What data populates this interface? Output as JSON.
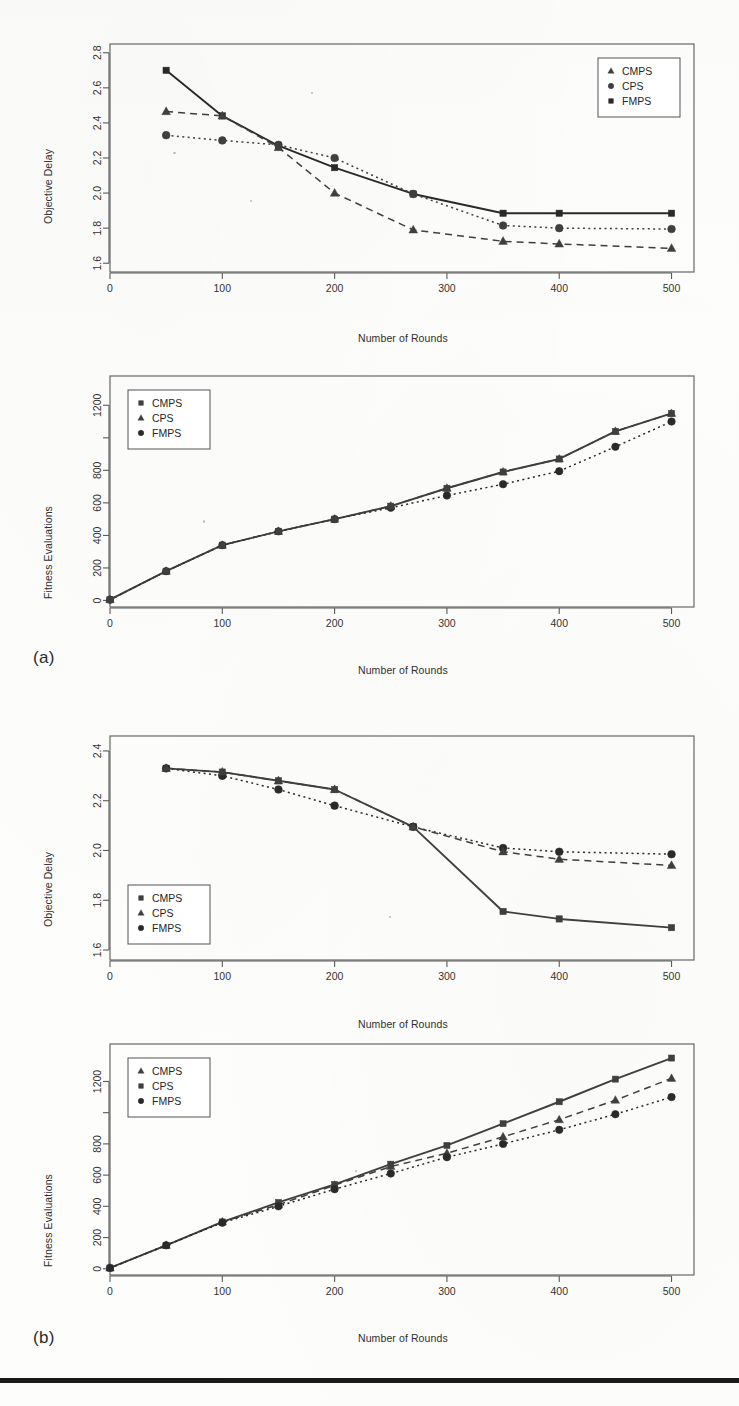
{
  "figure": {
    "panels": [
      {
        "id": "a",
        "label": "(a)"
      },
      {
        "id": "b",
        "label": "(b)"
      }
    ],
    "footer_rule_color": "#1a1a1a"
  },
  "series_style": {
    "CMPS": {
      "color": "#3f3f3f"
    },
    "CPS": {
      "color": "#3f3f3f"
    },
    "FMPS": {
      "color": "#2a2a2a"
    }
  },
  "chart_data": [
    {
      "id": "a-top",
      "type": "line",
      "title": "",
      "xlabel": "Number of Rounds",
      "ylabel": "Objective Delay",
      "xlim": [
        0,
        520
      ],
      "ylim": [
        1.55,
        2.85
      ],
      "xticks": [
        0,
        100,
        200,
        300,
        400,
        500
      ],
      "xtick_labels": [
        "0",
        "100",
        "200",
        "300",
        "400",
        "500"
      ],
      "yticks": [
        1.6,
        1.8,
        2.0,
        2.2,
        2.4,
        2.6,
        2.8
      ],
      "ytick_labels": [
        "1.6",
        "1.8",
        "2.0",
        "2.2",
        "2.4",
        "2.6",
        "2.8"
      ],
      "grid": false,
      "legend_position": "top-right",
      "legend": [
        {
          "name": "CMPS",
          "marker": "triangle"
        },
        {
          "name": "CPS",
          "marker": "circle"
        },
        {
          "name": "FMPS",
          "marker": "square"
        }
      ],
      "series": [
        {
          "name": "FMPS",
          "marker": "square",
          "line": "solid",
          "x": [
            50,
            100,
            150,
            200,
            270,
            350,
            400,
            500
          ],
          "values": [
            2.7,
            2.44,
            2.27,
            2.145,
            1.995,
            1.885,
            1.885,
            1.885
          ]
        },
        {
          "name": "CPS",
          "marker": "circle",
          "line": "dotted",
          "x": [
            50,
            100,
            150,
            200,
            270,
            350,
            400,
            500
          ],
          "values": [
            2.33,
            2.3,
            2.275,
            2.2,
            1.995,
            1.815,
            1.8,
            1.795
          ]
        },
        {
          "name": "CMPS",
          "marker": "triangle",
          "line": "dashed",
          "x": [
            50,
            100,
            150,
            200,
            270,
            350,
            400,
            500
          ],
          "values": [
            2.465,
            2.44,
            2.26,
            2.0,
            1.79,
            1.725,
            1.71,
            1.685
          ]
        }
      ]
    },
    {
      "id": "a-bottom",
      "type": "line",
      "title": "",
      "xlabel": "Number of Rounds",
      "ylabel": "Fitness Evaluations",
      "xlim": [
        0,
        520
      ],
      "ylim": [
        -40,
        1380
      ],
      "xticks": [
        0,
        100,
        200,
        300,
        400,
        500
      ],
      "xtick_labels": [
        "0",
        "100",
        "200",
        "300",
        "400",
        "500"
      ],
      "yticks": [
        0,
        200,
        400,
        600,
        800,
        1000,
        1200
      ],
      "ytick_labels": [
        "0",
        "200",
        "400",
        "600",
        "800",
        "",
        "1200"
      ],
      "grid": false,
      "legend_position": "top-left",
      "legend": [
        {
          "name": "CMPS",
          "marker": "square"
        },
        {
          "name": "CPS",
          "marker": "triangle"
        },
        {
          "name": "FMPS",
          "marker": "circle"
        }
      ],
      "series": [
        {
          "name": "CPS",
          "marker": "triangle",
          "line": "solid",
          "x": [
            0,
            50,
            100,
            150,
            200,
            250,
            300,
            350,
            400,
            450,
            500
          ],
          "values": [
            5,
            180,
            340,
            425,
            500,
            580,
            690,
            790,
            870,
            1040,
            1150
          ]
        },
        {
          "name": "FMPS",
          "marker": "circle",
          "line": "dotted",
          "x": [
            0,
            50,
            100,
            150,
            200,
            250,
            300,
            350,
            400,
            450,
            500
          ],
          "values": [
            5,
            180,
            340,
            425,
            500,
            570,
            645,
            715,
            795,
            945,
            1100
          ]
        },
        {
          "name": "CMPS",
          "marker": "square",
          "line": "dashed",
          "x": [
            0,
            50,
            100,
            150,
            200,
            250,
            300,
            350,
            400,
            450,
            500
          ],
          "values": [
            5,
            180,
            340,
            425,
            500,
            580,
            690,
            790,
            870,
            1040,
            1150
          ]
        }
      ]
    },
    {
      "id": "b-top",
      "type": "line",
      "title": "",
      "xlabel": "Number of Rounds",
      "ylabel": "Objective Delay",
      "xlim": [
        0,
        520
      ],
      "ylim": [
        1.56,
        2.46
      ],
      "xticks": [
        0,
        100,
        200,
        300,
        400,
        500
      ],
      "xtick_labels": [
        "0",
        "100",
        "200",
        "300",
        "400",
        "500"
      ],
      "yticks": [
        1.6,
        1.8,
        2.0,
        2.2,
        2.4
      ],
      "ytick_labels": [
        "1.6",
        "1.8",
        "2.0",
        "2.2",
        "2.4"
      ],
      "grid": false,
      "legend_position": "bottom-left",
      "legend": [
        {
          "name": "CMPS",
          "marker": "square"
        },
        {
          "name": "CPS",
          "marker": "triangle"
        },
        {
          "name": "FMPS",
          "marker": "circle"
        }
      ],
      "series": [
        {
          "name": "CMPS",
          "marker": "square",
          "line": "solid",
          "x": [
            50,
            100,
            150,
            200,
            270,
            350,
            400,
            500
          ],
          "values": [
            2.33,
            2.315,
            2.28,
            2.245,
            2.095,
            1.755,
            1.725,
            1.69
          ]
        },
        {
          "name": "FMPS",
          "marker": "circle",
          "line": "dotted",
          "x": [
            50,
            100,
            150,
            200,
            270,
            350,
            400,
            500
          ],
          "values": [
            2.33,
            2.3,
            2.245,
            2.18,
            2.095,
            2.01,
            1.995,
            1.985
          ]
        },
        {
          "name": "CPS",
          "marker": "triangle",
          "line": "dashed",
          "x": [
            50,
            100,
            150,
            200,
            270,
            350,
            400,
            500
          ],
          "values": [
            2.33,
            2.315,
            2.28,
            2.245,
            2.095,
            1.995,
            1.965,
            1.94
          ]
        }
      ]
    },
    {
      "id": "b-bottom",
      "type": "line",
      "title": "",
      "xlabel": "Number of Rounds",
      "ylabel": "Fitness Evaluations",
      "xlim": [
        0,
        520
      ],
      "ylim": [
        -40,
        1440
      ],
      "xticks": [
        0,
        100,
        200,
        300,
        400,
        500
      ],
      "xtick_labels": [
        "0",
        "100",
        "200",
        "300",
        "400",
        "500"
      ],
      "yticks": [
        0,
        200,
        400,
        600,
        800,
        1000,
        1200
      ],
      "ytick_labels": [
        "0",
        "200",
        "400",
        "600",
        "800",
        "",
        "1200"
      ],
      "grid": false,
      "legend_position": "top-left",
      "legend": [
        {
          "name": "CMPS",
          "marker": "triangle"
        },
        {
          "name": "CPS",
          "marker": "square"
        },
        {
          "name": "FMPS",
          "marker": "circle"
        }
      ],
      "series": [
        {
          "name": "CPS",
          "marker": "square",
          "line": "solid",
          "x": [
            0,
            50,
            100,
            150,
            200,
            250,
            300,
            350,
            400,
            450,
            500
          ],
          "values": [
            5,
            150,
            300,
            425,
            540,
            670,
            790,
            930,
            1070,
            1215,
            1350
          ]
        },
        {
          "name": "CMPS",
          "marker": "triangle",
          "line": "dashed",
          "x": [
            0,
            50,
            100,
            150,
            200,
            250,
            300,
            350,
            400,
            450,
            500
          ],
          "values": [
            5,
            150,
            300,
            410,
            535,
            655,
            740,
            845,
            955,
            1080,
            1220
          ]
        },
        {
          "name": "FMPS",
          "marker": "circle",
          "line": "dotted",
          "x": [
            0,
            50,
            100,
            150,
            200,
            250,
            300,
            350,
            400,
            450,
            500
          ],
          "values": [
            5,
            150,
            295,
            400,
            510,
            610,
            715,
            800,
            890,
            990,
            1100
          ]
        }
      ]
    }
  ]
}
